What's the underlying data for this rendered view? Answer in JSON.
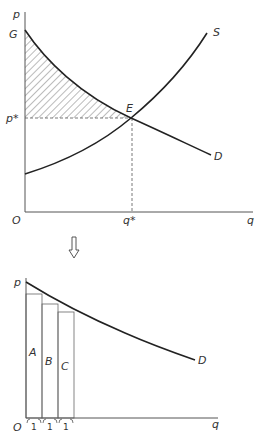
{
  "top_diagram": {
    "y_axis_label": "p",
    "x_axis_label": "q",
    "origin_label": "O",
    "intercept_label": "G",
    "price_label": "p*",
    "quantity_label": "q*",
    "equilibrium_label": "E",
    "supply_label": "S",
    "demand_label": "D",
    "shaded_region": "consumer surplus (hatched area between G, E and p*)"
  },
  "arrow": {
    "direction": "down"
  },
  "bottom_diagram": {
    "y_axis_label": "p",
    "x_axis_label": "q",
    "origin_label": "O",
    "demand_label": "D",
    "bars": [
      {
        "label": "A",
        "width_label": "1"
      },
      {
        "label": "B",
        "width_label": "1"
      },
      {
        "label": "C",
        "width_label": "1"
      }
    ]
  },
  "colors": {
    "line": "#222222",
    "text": "#333333",
    "axis": "#555555",
    "hatch": "#555555"
  }
}
